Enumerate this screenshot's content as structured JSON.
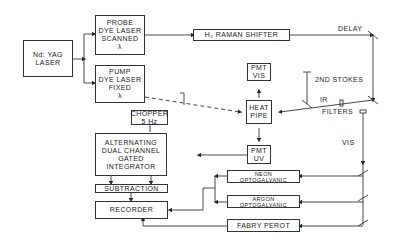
{
  "diagram": {
    "blocks": {
      "ndyag": [
        "Nd: YAG",
        "LASER"
      ],
      "probe": [
        "PROBE",
        "DYE LASER",
        "SCANNED",
        "λ"
      ],
      "pump": [
        "PUMP",
        "DYE LASER",
        "FIXED",
        "λ"
      ],
      "raman": "H₂ RAMAN SHIFTER",
      "pmt_vis": [
        "PMT",
        "VIS"
      ],
      "heat_pipe": [
        "HEAT",
        "PIPE"
      ],
      "pmt_uv": [
        "PMT",
        "UV"
      ],
      "chopper": [
        "CHOPPER",
        "5 Hz"
      ],
      "integrator": [
        "ALTERNATING",
        "DUAL CHANNEL",
        "GATED",
        "INTEGRATOR"
      ],
      "subtraction": "SUBTRACTION",
      "recorder": "RECORDER",
      "neon": [
        "NEON",
        "OPTOGALVANIC"
      ],
      "argon": [
        "ARGON",
        "OPTOGALVANIC"
      ],
      "fabry": "FABRY PEROT"
    },
    "labels": {
      "delay": "DELAY",
      "stokes": "2ND STOKES",
      "ir": "IR",
      "filters": "FILTERS",
      "vis": "VIS"
    }
  }
}
